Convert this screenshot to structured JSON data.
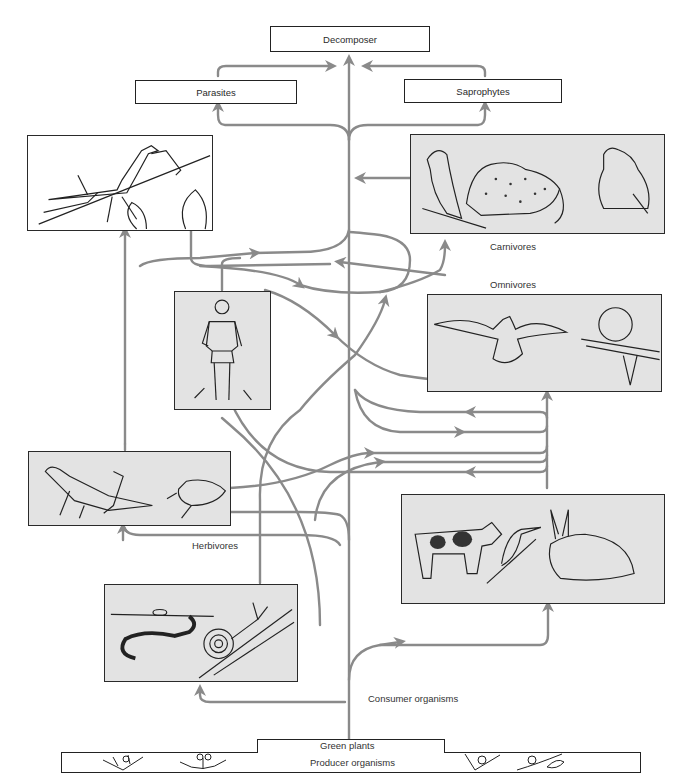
{
  "diagram": {
    "type": "food web",
    "top_boxes": {
      "decomposer": "Decomposer",
      "parasites": "Parasites",
      "saprophytes": "Saprophytes"
    },
    "labels": {
      "carnivores": "Carnivores",
      "omnivores": "Omnivores",
      "herbivores": "Herbivores",
      "consumer_organisms": "Consumer organisms",
      "green_plants": "Green plants",
      "producer_organisms": "Producer organisms"
    },
    "pictures": [
      {
        "id": "mantis",
        "description": "praying mantis on a leafy branch"
      },
      {
        "id": "carnivores",
        "description": "hawk, leopard, frog"
      },
      {
        "id": "human",
        "description": "walking man"
      },
      {
        "id": "omnivores",
        "description": "gull in flight, raccoon on a branch"
      },
      {
        "id": "insects",
        "description": "grasshopper and beetle"
      },
      {
        "id": "herbivores",
        "description": "cow, hummingbird, rabbit"
      },
      {
        "id": "soil",
        "description": "earthworm and snail"
      }
    ],
    "plants": [
      "plant-icon-1",
      "plant-icon-2",
      "plant-icon-3",
      "plant-icon-4"
    ],
    "colors": {
      "arrow": "#8a8a8a",
      "picture_bg": "#e3e3e3",
      "border": "#222222"
    }
  }
}
